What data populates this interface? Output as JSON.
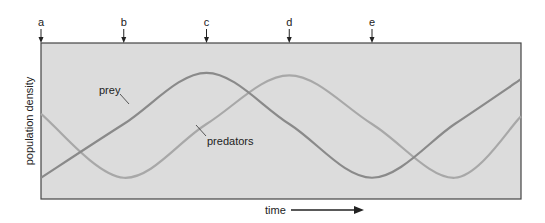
{
  "chart_data": {
    "type": "line",
    "title": "",
    "xlabel": "time",
    "ylabel": "population density",
    "x_axis_arrow": true,
    "time_markers": [
      "a",
      "b",
      "c",
      "d",
      "e"
    ],
    "x": [
      0,
      0.25,
      0.5,
      0.75,
      1.0,
      1.25,
      1.45
    ],
    "xlim": [
      0,
      1.45
    ],
    "ylim": [
      0,
      1
    ],
    "grid": false,
    "series": [
      {
        "name": "prey",
        "label": "prey",
        "color": "#8a8a8a",
        "note": "minimum at a, rising through b, maximum at c, falling through d, minimum at e, then rising again",
        "values": [
          0.08,
          0.5,
          0.9,
          0.5,
          0.08,
          0.5,
          0.85
        ]
      },
      {
        "name": "predators",
        "label": "predators",
        "color": "#a8a8a8",
        "note": "lags prey by a quarter cycle: minimum at b, maximum at d",
        "values": [
          0.58,
          0.08,
          0.5,
          0.88,
          0.5,
          0.08,
          0.56
        ]
      }
    ],
    "background": "#dcdcdc"
  }
}
